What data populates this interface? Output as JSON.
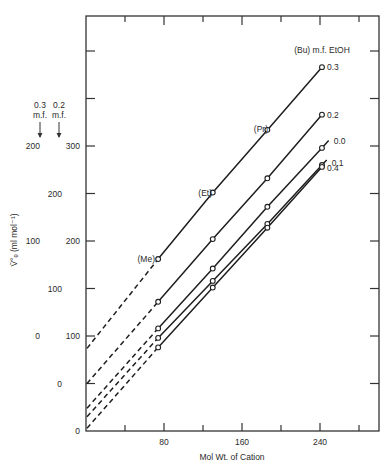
{
  "chart_data": {
    "type": "line",
    "title": "",
    "xlabel": "Mol Wt. of Cation",
    "ylabel": "V̄°ₑ (ml mol⁻¹)",
    "xlim": [
      0,
      300
    ],
    "x_ticks": [
      0,
      40,
      80,
      120,
      160,
      200,
      240,
      280
    ],
    "x_tick_labels": [
      "80",
      "160",
      "240"
    ],
    "x_tick_label_values": [
      80,
      160,
      240
    ],
    "legend_header": "(Bu) m.f. EtOH",
    "grid": false,
    "y_scales": [
      {
        "name": "primary (0.0, 0.1, 0.4 m.f.)",
        "labels": [
          "0",
          "100",
          "200",
          "300"
        ],
        "label_positions": [
          0,
          100,
          200,
          300
        ]
      },
      {
        "name": "0.2 m.f.",
        "header": "0.2 m.f.",
        "labels": [
          "0",
          "100",
          "200"
        ],
        "label_positions": [
          50,
          150,
          250
        ],
        "offset": 50
      },
      {
        "name": "0.3 m.f.",
        "header": "0.3 m.f.",
        "labels": [
          "0",
          "100",
          "200"
        ],
        "label_positions": [
          100,
          200,
          300
        ],
        "offset": 100
      }
    ],
    "point_annotations": [
      {
        "label": "(Me)",
        "x": 74
      },
      {
        "label": "(Et)",
        "x": 130
      },
      {
        "label": "(Pr)",
        "x": 186
      },
      {
        "label": "(Bu)",
        "x": 242
      }
    ],
    "x": [
      74,
      130,
      186,
      242
    ],
    "series": [
      {
        "name": "0.3",
        "scale_offset": 100,
        "values": [
          81,
          151,
          217,
          283
        ],
        "intercept": -13
      },
      {
        "name": "0.2",
        "scale_offset": 50,
        "values": [
          86,
          152,
          216,
          283
        ],
        "intercept": 0
      },
      {
        "name": "0.0",
        "scale_offset": 0,
        "values": [
          108,
          171,
          236,
          298
        ],
        "intercept": 24
      },
      {
        "name": "0.1",
        "scale_offset": 0,
        "values": [
          98,
          158,
          218,
          280
        ],
        "intercept": 15
      },
      {
        "name": "0.4",
        "scale_offset": 0,
        "values": [
          88,
          151,
          214,
          278
        ],
        "intercept": 3
      }
    ]
  },
  "labels": {
    "xlabel": "Mol Wt. of Cation",
    "ylabel_main": "V̄°ₑ (ml mol⁻¹)",
    "legend_header": "(Bu) m.f. EtOH",
    "scale_head_03_a": "0.3",
    "scale_head_03_b": "m.f.",
    "scale_head_02_a": "0.2",
    "scale_head_02_b": "m.f.",
    "me": "(Me)",
    "et": "(Et)",
    "pr": "(Pr)"
  }
}
